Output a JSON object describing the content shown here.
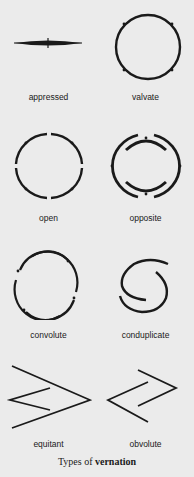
{
  "figures": [
    {
      "id": "appressed",
      "label": "appressed"
    },
    {
      "id": "valvate",
      "label": "valvate"
    },
    {
      "id": "open",
      "label": "open"
    },
    {
      "id": "opposite",
      "label": "opposite"
    },
    {
      "id": "convolute",
      "label": "convolute"
    },
    {
      "id": "conduplicate",
      "label": "conduplicate"
    },
    {
      "id": "equitant",
      "label": "equitant"
    },
    {
      "id": "obvolute",
      "label": "obvolute"
    }
  ],
  "caption": {
    "prefix": "Types of ",
    "emphasis": "vernation"
  },
  "colors": {
    "background": "#ebebeb",
    "ink": "#1a1a1a"
  }
}
